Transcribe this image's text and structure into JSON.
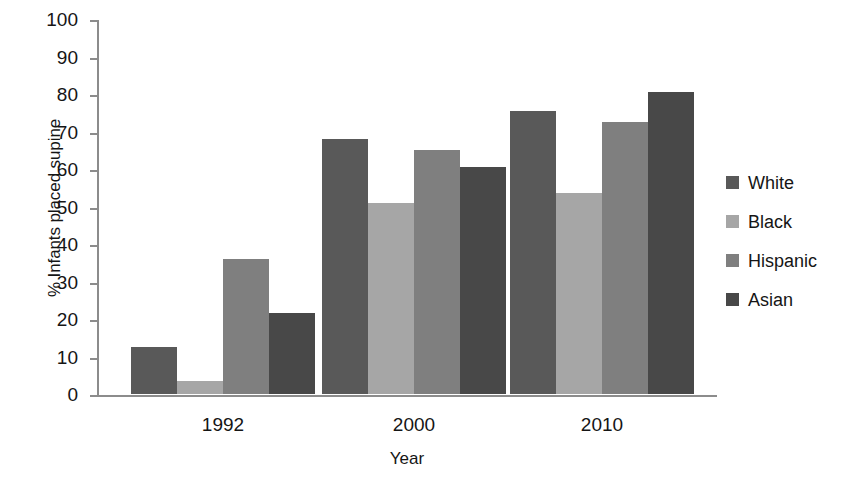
{
  "chart_data": {
    "type": "bar",
    "title": "",
    "subtitle": "",
    "xlabel": "Year",
    "ylabel": "% Infants placed supine",
    "categories": [
      "1992",
      "2000",
      "2010"
    ],
    "series": [
      {
        "name": "White",
        "color": "#595959",
        "values": [
          12.5,
          68.0,
          75.5
        ]
      },
      {
        "name": "Black",
        "color": "#a6a6a6",
        "values": [
          3.5,
          51.0,
          53.5
        ]
      },
      {
        "name": "Hispanic",
        "color": "#7f7f7f",
        "values": [
          36.0,
          65.0,
          72.5
        ]
      },
      {
        "name": "Asian",
        "color": "#484848",
        "values": [
          21.5,
          60.5,
          80.5
        ]
      }
    ],
    "ylim": [
      0,
      100
    ],
    "ytick_values": [
      0,
      10,
      20,
      30,
      40,
      50,
      60,
      70,
      80,
      90,
      100
    ],
    "ytick_labels": [
      "0",
      "10",
      "20",
      "30",
      "40",
      "50",
      "60",
      "70",
      "80",
      "90",
      "100"
    ],
    "grid": false,
    "legend_position": "right",
    "bar_grouping": "clustered",
    "axis_color": "#8c8c8c"
  },
  "legend": {
    "entries": [
      {
        "label": "White"
      },
      {
        "label": "Black"
      },
      {
        "label": "Hispanic"
      },
      {
        "label": "Asian"
      }
    ]
  },
  "axes": {
    "x_title": "Year",
    "y_title": "% Infants placed supine"
  }
}
